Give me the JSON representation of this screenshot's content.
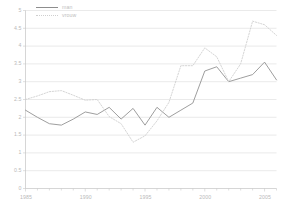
{
  "chart_data": {
    "type": "line",
    "title": "",
    "xlabel": "",
    "ylabel": "",
    "xlim": [
      1985,
      2006
    ],
    "ylim": [
      0,
      5
    ],
    "ytick_step": 0.5,
    "grid": true,
    "grid_axis": "y",
    "legend_position": "top-left-inside",
    "ytick_labels": [
      "5",
      "4.5",
      "4",
      "3.5",
      "3",
      "2.5",
      "2",
      "1.5",
      "1",
      "0.5",
      "0"
    ],
    "ytick_values": [
      5,
      4.5,
      4,
      3.5,
      3,
      2.5,
      2,
      1.5,
      1,
      0.5,
      0
    ],
    "xtick_labels": [
      "1985",
      "1990",
      "1995",
      "2000",
      "2005"
    ],
    "xtick_values": [
      1985,
      1990,
      1995,
      2000,
      2005
    ],
    "x": [
      1985,
      1986,
      1987,
      1988,
      1989,
      1990,
      1991,
      1992,
      1993,
      1994,
      1995,
      1996,
      1997,
      1998,
      1999,
      2000,
      2001,
      2002,
      2003,
      2004,
      2005,
      2006
    ],
    "series": [
      {
        "name": "man",
        "style": "solid",
        "color": "#8d8d8d",
        "values": [
          2.2,
          2.0,
          1.82,
          1.78,
          1.95,
          2.15,
          2.08,
          2.28,
          1.95,
          2.25,
          1.78,
          2.28,
          2.0,
          2.2,
          2.4,
          3.3,
          3.42,
          3.0,
          3.1,
          3.2,
          3.55,
          3.05
        ]
      },
      {
        "name": "vrouw",
        "style": "dotted",
        "color": "#cfcfcf",
        "values": [
          2.5,
          2.6,
          2.72,
          2.75,
          2.62,
          2.48,
          2.5,
          2.02,
          1.82,
          1.3,
          1.48,
          1.9,
          2.42,
          3.45,
          3.45,
          3.95,
          3.7,
          3.0,
          3.5,
          4.7,
          4.6,
          4.3
        ]
      }
    ]
  },
  "legend": {
    "items": [
      {
        "label": "man",
        "style": "solid"
      },
      {
        "label": "vrouw",
        "style": "dotted"
      }
    ]
  },
  "axis_colors": {
    "grid": "#d9d9d9",
    "axis": "#c4c4c4",
    "text": "#bdbdbd"
  }
}
